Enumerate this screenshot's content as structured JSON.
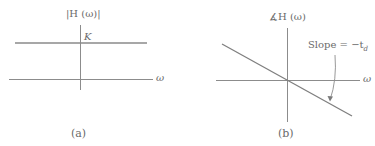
{
  "panel_a": {
    "y_label": "|H (ω)|",
    "level_label": "K",
    "x_label": "ω",
    "caption": "(a)"
  },
  "panel_b": {
    "y_label": "∡H (ω)",
    "x_label": "ω",
    "slope_label": "Slope = −t",
    "slope_subscript": "d",
    "caption": "(b)"
  },
  "colors": {
    "line": "#8a8a8a",
    "axis": "#8c8c8c",
    "text": "#6a6a6a"
  }
}
